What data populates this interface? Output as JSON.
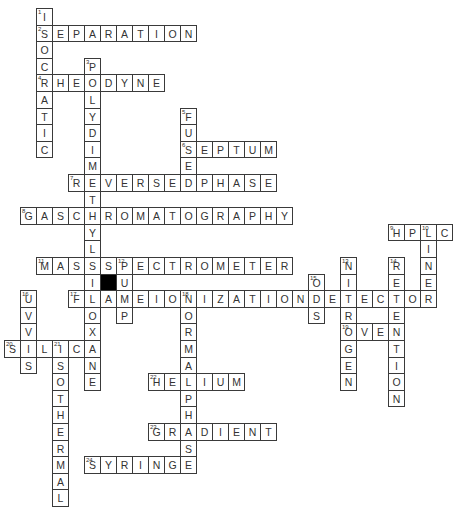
{
  "puzzle": {
    "grid": {
      "origin_x": 4,
      "origin_y": 8,
      "cell_w": 16,
      "cell_h": 16.6
    },
    "colors": {
      "line": "#3a3a3a",
      "text": "#333333",
      "block": "#000000",
      "background": "#ffffff"
    },
    "words": [
      {
        "number": 1,
        "direction": "down",
        "answer": "ISOCRATIC",
        "row": 0,
        "col": 2
      },
      {
        "number": 2,
        "direction": "across",
        "answer": "SEPARATION",
        "row": 1,
        "col": 2
      },
      {
        "number": 3,
        "direction": "down",
        "answer": "POLYDIMETHYLSILOXANE",
        "row": 3,
        "col": 5
      },
      {
        "number": 4,
        "direction": "across",
        "answer": "RHEODYNE",
        "row": 4,
        "col": 2
      },
      {
        "number": 5,
        "direction": "down",
        "answer": "FUSED",
        "row": 6,
        "col": 11
      },
      {
        "number": 6,
        "direction": "across",
        "answer": "SEPTUM",
        "row": 8,
        "col": 11
      },
      {
        "number": 7,
        "direction": "across",
        "answer": "REVERSEDPHASE",
        "row": 10,
        "col": 4
      },
      {
        "number": 8,
        "direction": "across",
        "answer": "GASCHROMATOGRAPHY",
        "row": 12,
        "col": 1
      },
      {
        "number": 9,
        "direction": "across",
        "answer": "HPLC",
        "row": 13,
        "col": 24
      },
      {
        "number": 10,
        "direction": "down",
        "answer": "LINER",
        "row": 13,
        "col": 26
      },
      {
        "number": 11,
        "direction": "across",
        "answer": "MASSSPECTROMETER",
        "row": 15,
        "col": 2
      },
      {
        "number": 12,
        "direction": "down",
        "answer": "PUMP",
        "row": 15,
        "col": 7
      },
      {
        "number": 13,
        "direction": "down",
        "answer": "NITROGEN",
        "row": 15,
        "col": 21
      },
      {
        "number": 14,
        "direction": "down",
        "answer": "RETENTION",
        "row": 15,
        "col": 24
      },
      {
        "number": 15,
        "direction": "down",
        "answer": "ODS",
        "row": 16,
        "col": 19
      },
      {
        "number": 16,
        "direction": "down",
        "answer": "UVVIS",
        "row": 17,
        "col": 1
      },
      {
        "number": 17,
        "direction": "across",
        "answer": "FLAMEIONIZATIONDETECTOR",
        "row": 17,
        "col": 4
      },
      {
        "number": 18,
        "direction": "down",
        "answer": "NORMALPHASE",
        "row": 17,
        "col": 11
      },
      {
        "number": 19,
        "direction": "across",
        "answer": "OVEN",
        "row": 19,
        "col": 21
      },
      {
        "number": 20,
        "direction": "across",
        "answer": "SILICA",
        "row": 20,
        "col": 0
      },
      {
        "number": 21,
        "direction": "down",
        "answer": "ISOTHERMAL",
        "row": 20,
        "col": 3
      },
      {
        "number": 22,
        "direction": "across",
        "answer": "HELIUM",
        "row": 22,
        "col": 9
      },
      {
        "number": 23,
        "direction": "across",
        "answer": "GRADIENT",
        "row": 25,
        "col": 9
      },
      {
        "number": 24,
        "direction": "across",
        "answer": "SYRINGE",
        "row": 27,
        "col": 5
      }
    ],
    "blocks": [
      {
        "row": 16,
        "col": 6
      }
    ]
  }
}
